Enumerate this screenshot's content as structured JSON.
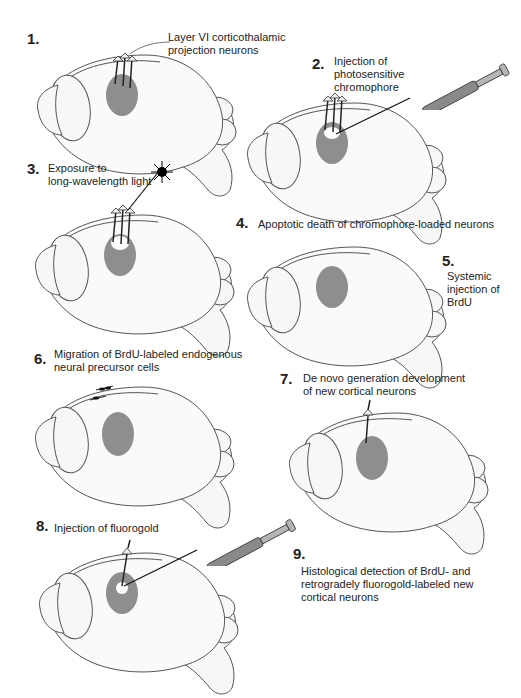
{
  "figure": {
    "steps": [
      {
        "num": "1.",
        "text_lines": [
          "Layer VI corticothalamic",
          "projection neurons"
        ]
      },
      {
        "num": "2.",
        "text_lines": [
          "Injection of",
          "photosensitive",
          "chromophore"
        ]
      },
      {
        "num": "3.",
        "text_lines": [
          "Exposure to",
          "long-wavelength light"
        ]
      },
      {
        "num": "4.",
        "text_lines": [
          "Apoptotic death of chromophore-loaded neurons"
        ]
      },
      {
        "num": "5.",
        "text_lines": [
          "Systemic",
          "injection of",
          "BrdU"
        ]
      },
      {
        "num": "6.",
        "text_lines": [
          "Migration of BrdU-labeled endogenous",
          "neural precursor cells"
        ]
      },
      {
        "num": "7.",
        "text_lines": [
          "De novo generation development",
          "of new cortical neurons"
        ]
      },
      {
        "num": "8.",
        "text_lines": [
          "Injection of fluorogold"
        ]
      },
      {
        "num": "9.",
        "text_lines": [
          "Histological detection of BrdU- and",
          "retrogradely fluorogold-labeled new",
          "cortical neurons"
        ]
      }
    ],
    "colors": {
      "target_area": "#8e8e8e",
      "outline": "#555555",
      "text": "#222222"
    }
  }
}
